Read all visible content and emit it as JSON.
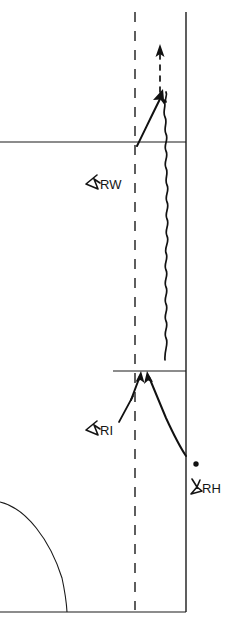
{
  "figure": {
    "kind": "hand-drawn-schematic",
    "background_color": "#ffffff",
    "ink_color": "#141414",
    "width": 231,
    "height": 625
  },
  "labels": {
    "wind_region": {
      "text": "RW",
      "glyph": "angle-marker-icon",
      "x": 106,
      "y": 186
    },
    "interface_region": {
      "text": "RI",
      "glyph": "angle-marker-icon",
      "x": 106,
      "y": 432
    },
    "heat_region": {
      "text": "RH",
      "glyph": "angle-marker-icon",
      "x": 207,
      "y": 492
    }
  },
  "markers": {
    "point_dot": {
      "name": "point-dot-marker",
      "x": 196,
      "y": 464,
      "radius": 2.6
    }
  },
  "boundaries": {
    "axis_dashed_vertical": {
      "name": "dashed-axis",
      "x": 135,
      "y_top": 12,
      "y_bottom": 610,
      "dash_pattern": "10 9"
    },
    "wall_solid_vertical": {
      "name": "solid-wall",
      "x": 186,
      "y_top": 12,
      "y_bottom": 612
    },
    "upper_horizontal": {
      "name": "upper-boundary-line",
      "x_start": 0,
      "x_end": 186,
      "y": 142
    },
    "lower_horizontal": {
      "name": "lower-boundary-line",
      "x_start": 113,
      "x_end": 186,
      "y": 371
    },
    "base_horizontal": {
      "name": "base-boundary-line",
      "x_start": 0,
      "x_end": 186,
      "y": 612
    }
  },
  "curves": {
    "corner_arc": {
      "name": "quarter-circle-arc",
      "start_x": 0,
      "start_y": 502,
      "end_x": 67,
      "end_y": 612
    },
    "wavy_trajectory": {
      "name": "wavy-trajectory-line",
      "x": 165,
      "y_top": 100,
      "y_bottom": 360,
      "amplitude": 2.2
    }
  },
  "arrows": {
    "dashed_up": {
      "name": "dashed-up-arrow",
      "x": 160,
      "y_tail": 92,
      "y_head": 45
    },
    "solid_up_long": {
      "name": "solid-up-arrow",
      "x_tail": 137,
      "y_tail": 145,
      "x_head": 163,
      "y_head": 92
    },
    "interface_left": {
      "name": "interface-left-arrow",
      "x_tail": 133,
      "y_tail": 398,
      "x_head": 141,
      "y_head": 374
    },
    "interface_right": {
      "name": "interface-right-arrow",
      "x_tail": 186,
      "y_tail": 455,
      "x_head": 148,
      "y_head": 374
    }
  },
  "leaders": {
    "ri_leader": {
      "name": "ri-leader-line",
      "x_start": 119,
      "y_start": 421,
      "x_end": 134,
      "y_end": 394
    }
  }
}
